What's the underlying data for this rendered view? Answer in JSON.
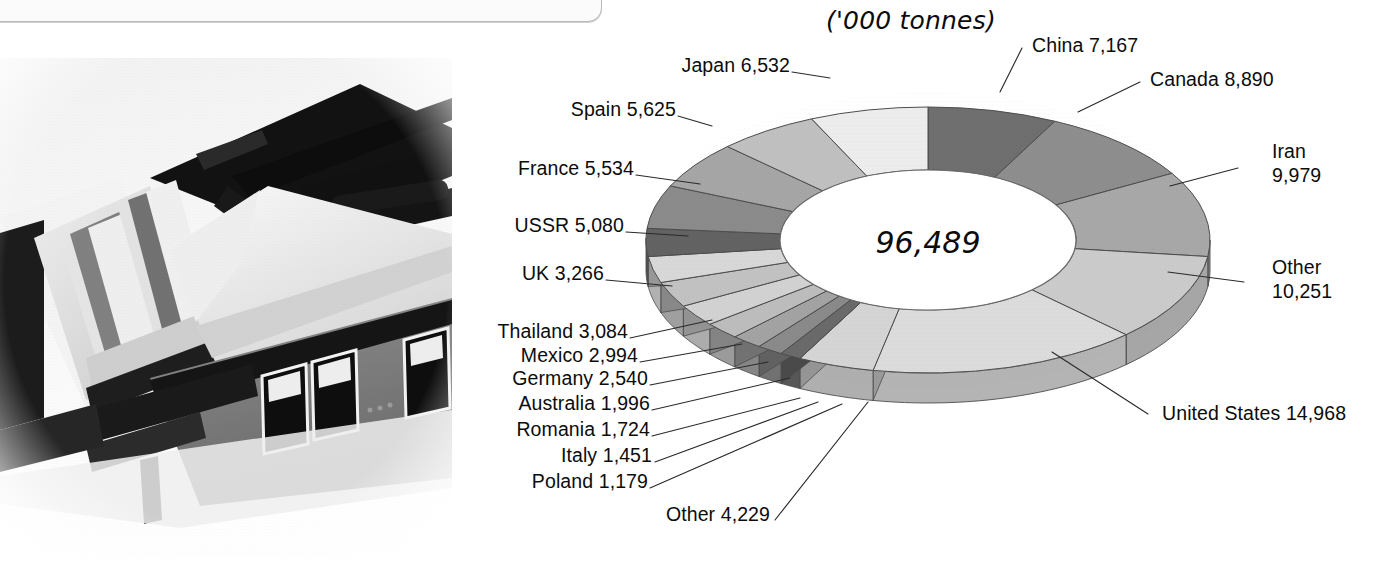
{
  "chart_data": {
    "type": "pie",
    "title": "('000 tonnes)",
    "subtitle": "",
    "units": "'000 tonnes",
    "center_label": "96,489",
    "total": 96489,
    "xlabel": "",
    "ylabel": "",
    "legend_position": "callout-labels",
    "grid": false,
    "categories": [
      "China",
      "Canada",
      "Iran",
      "Other",
      "United States",
      "Other",
      "Poland",
      "Italy",
      "Romania",
      "Australia",
      "Germany",
      "Mexico",
      "Thailand",
      "UK",
      "USSR",
      "France",
      "Spain",
      "Japan"
    ],
    "values": [
      7167,
      8890,
      9979,
      10251,
      14968,
      4229,
      1179,
      1451,
      1724,
      1996,
      2540,
      2994,
      3084,
      3266,
      5080,
      5534,
      5625,
      6532
    ],
    "slices": [
      {
        "name": "China",
        "value": 7167,
        "label": "China 7,167",
        "shade": "#6f6f6f"
      },
      {
        "name": "Canada",
        "value": 8890,
        "label": "Canada 8,890",
        "shade": "#8e8e8e"
      },
      {
        "name": "Iran",
        "value": 9979,
        "label": "Iran 9,979",
        "shade": "#a8a8a8"
      },
      {
        "name": "Other (right)",
        "value": 10251,
        "label": "Other 10,251",
        "shade": "#cbcbcb"
      },
      {
        "name": "United States",
        "value": 14968,
        "label": "United States 14,968",
        "shade": "#dcdcdc"
      },
      {
        "name": "Other (bottom)",
        "value": 4229,
        "label": "Other 4,229",
        "shade": "#d5d5d5"
      },
      {
        "name": "Poland",
        "value": 1179,
        "label": "Poland 1,179",
        "shade": "#6a6a6a"
      },
      {
        "name": "Italy",
        "value": 1451,
        "label": "Italy 1,451",
        "shade": "#8a8a8a"
      },
      {
        "name": "Romania",
        "value": 1724,
        "label": "Romania 1,724",
        "shade": "#a3a3a3"
      },
      {
        "name": "Australia",
        "value": 1996,
        "label": "Australia 1,996",
        "shade": "#bdbdbd"
      },
      {
        "name": "Germany",
        "value": 2540,
        "label": "Germany 2,540",
        "shade": "#d2d2d2"
      },
      {
        "name": "Mexico",
        "value": 2994,
        "label": "Mexico 2,994",
        "shade": "#c2c2c2"
      },
      {
        "name": "Thailand",
        "value": 3084,
        "label": "Thailand 3,084",
        "shade": "#d8d8d8"
      },
      {
        "name": "UK",
        "value": 3266,
        "label": "UK 3,266",
        "shade": "#636363"
      },
      {
        "name": "USSR",
        "value": 5080,
        "label": "USSR 5,080",
        "shade": "#8b8b8b"
      },
      {
        "name": "France",
        "value": 5534,
        "label": "France 5,534",
        "shade": "#a6a6a6"
      },
      {
        "name": "Spain",
        "value": 5625,
        "label": "Spain 5,625",
        "shade": "#c0c0c0"
      },
      {
        "name": "Japan",
        "value": 6532,
        "label": "Japan 6,532",
        "shade": "#ededed"
      }
    ],
    "labels": {
      "units": "('000 tonnes)",
      "center": "96,489",
      "china": "China 7,167",
      "canada": "Canada 8,890",
      "iran_name": "Iran",
      "iran_value": "9,979",
      "other_right_name": "Other",
      "other_right_value": "10,251",
      "united_states": "United States 14,968",
      "other_bottom": "Other 4,229",
      "poland": "Poland 1,179",
      "italy": "Italy 1,451",
      "romania": "Romania 1,724",
      "australia": "Australia 1,996",
      "germany": "Germany 2,540",
      "mexico": "Mexico 2,994",
      "thailand": "Thailand 3,084",
      "uk": "UK 3,266",
      "ussr": "USSR 5,080",
      "france": "France 5,534",
      "spain": "Spain 5,625",
      "japan": "Japan 6,532"
    }
  },
  "photo": {
    "name": "industrial-machinery-photograph",
    "description": "Black and white photograph of tilted industrial machinery and building"
  },
  "colors": {
    "background": "#ffffff",
    "text": "#0c0c0c",
    "outline": "#555555",
    "darkest_slice": "#636363",
    "lightest_slice": "#ededed"
  }
}
